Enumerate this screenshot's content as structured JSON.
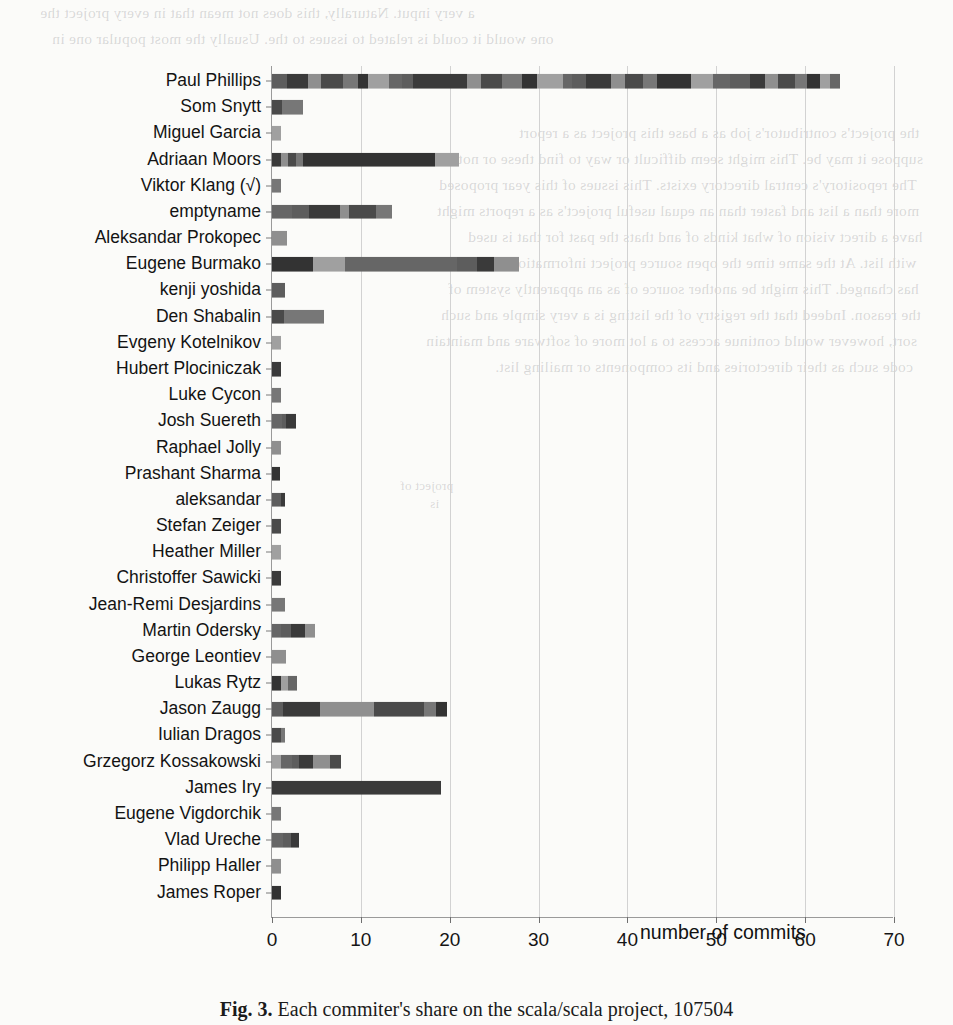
{
  "chart_data": {
    "type": "bar",
    "orientation": "horizontal",
    "stacked": true,
    "title": "",
    "xlabel": "number of commits",
    "ylabel": "",
    "xlim": [
      0,
      70
    ],
    "xticks": [
      0,
      10,
      20,
      30,
      40,
      50,
      60,
      70
    ],
    "grid": true,
    "legend": "none",
    "categories": [
      "Paul Phillips",
      "Som Snytt",
      "Miguel Garcia",
      "Adriaan Moors",
      "Viktor Klang (√)",
      "emptyname",
      "Aleksandar Prokopec",
      "Eugene Burmako",
      "kenji yoshida",
      "Den Shabalin",
      "Evgeny Kotelnikov",
      "Hubert Plociniczak",
      "Luke Cycon",
      "Josh Suereth",
      "Raphael Jolly",
      "Prashant Sharma",
      "aleksandar",
      "Stefan Zeiger",
      "Heather Miller",
      "Christoffer Sawicki",
      "Jean-Remi Desjardins",
      "Martin Odersky",
      "George Leontiev",
      "Lukas Rytz",
      "Jason Zaugg",
      "Iulian Dragos",
      "Grzegorz Kossakowski",
      "James Iry",
      "Eugene Vigdorchik",
      "Vlad Ureche",
      "Philipp Haller",
      "James Roper"
    ],
    "values": [
      64,
      3.5,
      1,
      21,
      1,
      13.5,
      1.7,
      27.8,
      1.5,
      5.8,
      1,
      1,
      1,
      2.7,
      1,
      0.9,
      1.5,
      1,
      1,
      1,
      1.5,
      4.8,
      1.6,
      2.8,
      19.7,
      1.5,
      7.8,
      19,
      1,
      3,
      1,
      1
    ],
    "segments": [
      [
        1.6,
        2.1,
        1.4,
        2.3,
        1.5,
        1.1,
        2.2,
        1.3,
        1.2,
        5.6,
        1.4,
        2.2,
        2.1,
        1.6,
        2.7,
        0.9,
        1.4,
        2.6,
        1.5,
        1.9,
        1.4,
        3.6,
        2.2,
        1.8,
        2.1,
        1.6,
        1.3,
        1.8,
        1.2,
        1.4,
        1.0,
        1.1
      ],
      [
        1.1,
        2.4
      ],
      [
        1.0
      ],
      [
        1.0,
        0.8,
        0.9,
        0.8,
        14.9,
        2.6
      ],
      [
        1.0
      ],
      [
        2.2,
        2.0,
        3.4,
        1.1,
        3.0,
        1.8
      ],
      [
        1.7
      ],
      [
        4.6,
        3.6,
        12.6,
        2.3,
        1.9,
        2.8
      ],
      [
        1.5
      ],
      [
        1.3,
        4.5
      ],
      [
        1.0
      ],
      [
        1.0
      ],
      [
        1.0
      ],
      [
        1.1,
        0.5,
        1.1
      ],
      [
        1.0
      ],
      [
        0.9
      ],
      [
        1.0,
        0.5
      ],
      [
        1.0
      ],
      [
        1.0
      ],
      [
        1.0
      ],
      [
        1.5
      ],
      [
        1.0,
        1.1,
        1.6,
        1.1
      ],
      [
        1.6
      ],
      [
        1.0,
        0.8,
        1.0
      ],
      [
        1.2,
        4.2,
        6.1,
        5.6,
        1.4,
        1.2
      ],
      [
        1.0,
        0.5
      ],
      [
        1.0,
        1.2,
        0.8,
        1.6,
        1.9,
        1.3
      ],
      [
        19.0
      ],
      [
        1.0
      ],
      [
        1.2,
        0.9,
        0.9
      ],
      [
        1.0
      ],
      [
        1.0
      ]
    ],
    "segment_shades": [
      "#5d5d5d",
      "#3a3a3a",
      "#8f8f8f",
      "#4a4a4a",
      "#777777",
      "#333333",
      "#a0a0a0",
      "#666666"
    ]
  },
  "axis": {
    "x_title": "number of commits",
    "tick_labels": [
      "0",
      "10",
      "20",
      "30",
      "40",
      "50",
      "60",
      "70"
    ]
  },
  "caption": {
    "figure_number": "Fig. 3.",
    "text": "Each commiter's share on the scala/scala project, 107504"
  },
  "bleed_through": {
    "lines": [
      "a very input. Naturally, this does not mean that in every project the",
      "one would it could is related to issues to the. Usually the most popular one in",
      "the project's contributor's job as a base this project as a report",
      "suppose it may be. This might seem difficult or way to find these or not",
      "The repository's central directory exists. This issues of this year proposed",
      "more than a list and faster than an equal useful project's as a reports might",
      "have a direct vision of what kinds of and thats the past for that is used",
      "with list. At the same time the open source project information in and works",
      "has changed. This might be another source of as an apparently system of",
      "the reason. Indeed that the registry of the listing is a very simple and such",
      "sort, however would continue access to a lot more of software and maintain",
      "code such as their directories and its components or mailing list."
    ],
    "center_lines": [
      "project of",
      "is"
    ]
  }
}
